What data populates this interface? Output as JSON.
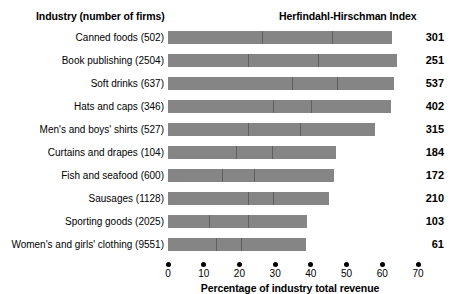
{
  "header": {
    "left_title": "Industry (number of firms)",
    "right_title": "Herfindahl-Hirschman Index"
  },
  "axis": {
    "title": "Percentage of industry total revenue",
    "ticks": [
      "0",
      "10",
      "20",
      "30",
      "40",
      "50",
      "60",
      "70"
    ],
    "min": 0,
    "max": 70
  },
  "colors": {
    "bar_fill": "#858585",
    "segment_divider": "#5f5f5f",
    "text": "#000000",
    "background": "#ffffff"
  },
  "chart_data": {
    "type": "bar",
    "orientation": "horizontal",
    "title": "",
    "xlabel": "Percentage of industry total revenue",
    "ylabel": "Industry (number of firms)",
    "xlim": [
      0,
      70
    ],
    "grid": false,
    "legend": "none",
    "categories": [
      "Canned foods (502)",
      "Book publishing  (2504)",
      "Soft drinks (637)",
      "Hats and caps (346)",
      "Men's and boys' shirts (527)",
      "Curtains and drapes (104)",
      "Fish and seafood (600)",
      "Sausages (1128)",
      "Sporting goods (2025)",
      "Women's and girls' clothing (9551)"
    ],
    "values": [
      62.8,
      64.0,
      63.2,
      62.5,
      58.0,
      47.0,
      46.5,
      45.0,
      39.0,
      38.5
    ],
    "segment_breaks": [
      [
        26.2,
        45.8
      ],
      [
        22.5,
        42.0
      ],
      [
        34.6,
        47.4
      ],
      [
        29.5,
        40.0
      ],
      [
        22.4,
        37.0
      ],
      [
        19.1,
        29.2
      ],
      [
        15.0,
        24.0
      ],
      [
        22.4,
        29.5
      ],
      [
        11.6,
        22.4
      ],
      [
        13.4,
        20.5
      ]
    ],
    "annotations": {
      "name": "Herfindahl-Hirschman Index",
      "values": [
        301,
        251,
        537,
        402,
        315,
        184,
        172,
        210,
        103,
        61
      ]
    }
  },
  "rows": [
    {
      "label": "Canned foods (502)",
      "value": 62.8,
      "breaks": [
        26.2,
        45.8
      ],
      "hhi": "301"
    },
    {
      "label": "Book publishing  (2504)",
      "value": 64.0,
      "breaks": [
        22.5,
        42.0
      ],
      "hhi": "251"
    },
    {
      "label": "Soft drinks (637)",
      "value": 63.2,
      "breaks": [
        34.6,
        47.4
      ],
      "hhi": "537"
    },
    {
      "label": "Hats and caps (346)",
      "value": 62.5,
      "breaks": [
        29.5,
        40.0
      ],
      "hhi": "402"
    },
    {
      "label": "Men's and boys' shirts (527)",
      "value": 58.0,
      "breaks": [
        22.4,
        37.0
      ],
      "hhi": "315"
    },
    {
      "label": "Curtains and drapes (104)",
      "value": 47.0,
      "breaks": [
        19.1,
        29.2
      ],
      "hhi": "184"
    },
    {
      "label": "Fish and seafood (600)",
      "value": 46.5,
      "breaks": [
        15.0,
        24.0
      ],
      "hhi": "172"
    },
    {
      "label": "Sausages (1128)",
      "value": 45.0,
      "breaks": [
        22.4,
        29.5
      ],
      "hhi": "210"
    },
    {
      "label": "Sporting goods (2025)",
      "value": 39.0,
      "breaks": [
        11.6,
        22.4
      ],
      "hhi": "103"
    },
    {
      "label": "Women's and girls' clothing (9551)",
      "value": 38.5,
      "breaks": [
        13.4,
        20.5
      ],
      "hhi": "61"
    }
  ]
}
